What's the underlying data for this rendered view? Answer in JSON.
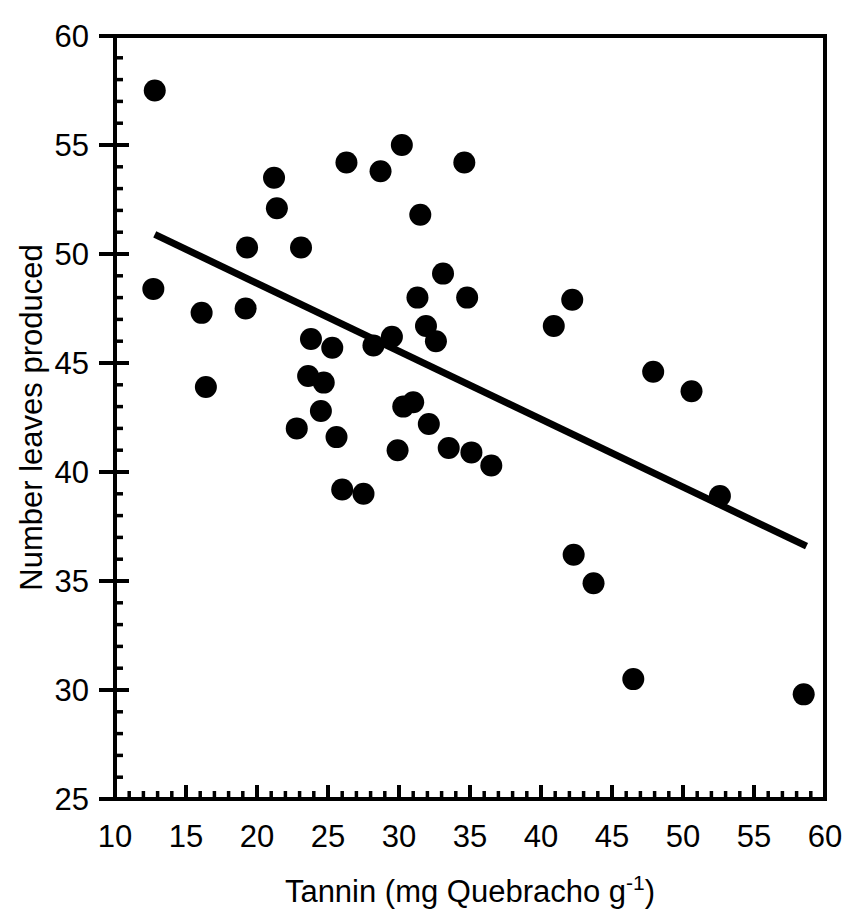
{
  "chart_data": {
    "type": "scatter",
    "title": "",
    "xlabel": "Tannin (mg Quebracho g-1)",
    "xlabel_base": "Tannin (mg Quebracho g",
    "xlabel_sup": "-1",
    "xlabel_tail": ")",
    "ylabel": "Number leaves produced",
    "xlim": [
      10,
      60
    ],
    "ylim": [
      25,
      60
    ],
    "xticks": [
      10,
      15,
      20,
      25,
      30,
      35,
      40,
      45,
      50,
      55,
      60
    ],
    "yticks": [
      25,
      30,
      35,
      40,
      45,
      50,
      55,
      60
    ],
    "xtick_labels": [
      "10",
      "15",
      "20",
      "25",
      "30",
      "35",
      "40",
      "45",
      "50",
      "55",
      "60"
    ],
    "ytick_labels": [
      "25",
      "30",
      "35",
      "40",
      "45",
      "50",
      "55",
      "60"
    ],
    "minor_tick_step": 1,
    "grid": false,
    "legend": null,
    "marker": "filled-circle",
    "marker_color": "#000000",
    "marker_size_px": 22,
    "points": [
      {
        "x": 12.8,
        "y": 57.5
      },
      {
        "x": 12.7,
        "y": 48.4
      },
      {
        "x": 16.1,
        "y": 47.3
      },
      {
        "x": 16.4,
        "y": 43.9
      },
      {
        "x": 19.2,
        "y": 47.5
      },
      {
        "x": 19.3,
        "y": 50.3
      },
      {
        "x": 21.2,
        "y": 53.5
      },
      {
        "x": 21.4,
        "y": 52.1
      },
      {
        "x": 22.8,
        "y": 42.0
      },
      {
        "x": 23.1,
        "y": 50.3
      },
      {
        "x": 23.6,
        "y": 44.4
      },
      {
        "x": 23.8,
        "y": 46.1
      },
      {
        "x": 24.5,
        "y": 42.8
      },
      {
        "x": 24.7,
        "y": 44.1
      },
      {
        "x": 25.3,
        "y": 45.7
      },
      {
        "x": 25.6,
        "y": 41.6
      },
      {
        "x": 26.0,
        "y": 39.2
      },
      {
        "x": 26.3,
        "y": 54.2
      },
      {
        "x": 27.5,
        "y": 39.0
      },
      {
        "x": 28.2,
        "y": 45.8
      },
      {
        "x": 28.7,
        "y": 53.8
      },
      {
        "x": 29.5,
        "y": 46.2
      },
      {
        "x": 29.9,
        "y": 41.0
      },
      {
        "x": 30.2,
        "y": 55.0
      },
      {
        "x": 30.3,
        "y": 43.0
      },
      {
        "x": 31.0,
        "y": 43.2
      },
      {
        "x": 31.3,
        "y": 48.0
      },
      {
        "x": 31.5,
        "y": 51.8
      },
      {
        "x": 31.9,
        "y": 46.7
      },
      {
        "x": 32.1,
        "y": 42.2
      },
      {
        "x": 32.6,
        "y": 46.0
      },
      {
        "x": 33.1,
        "y": 49.1
      },
      {
        "x": 33.5,
        "y": 41.1
      },
      {
        "x": 34.6,
        "y": 54.2
      },
      {
        "x": 34.8,
        "y": 48.0
      },
      {
        "x": 35.1,
        "y": 40.9
      },
      {
        "x": 36.5,
        "y": 40.3
      },
      {
        "x": 40.9,
        "y": 46.7
      },
      {
        "x": 42.2,
        "y": 47.9
      },
      {
        "x": 42.3,
        "y": 36.2
      },
      {
        "x": 43.7,
        "y": 34.9
      },
      {
        "x": 46.5,
        "y": 30.5
      },
      {
        "x": 47.9,
        "y": 44.6
      },
      {
        "x": 50.6,
        "y": 43.7
      },
      {
        "x": 52.6,
        "y": 38.9
      },
      {
        "x": 58.5,
        "y": 29.8
      }
    ],
    "trendline": {
      "label": "regression line",
      "x1": 12.8,
      "y1": 50.9,
      "x2": 58.7,
      "y2": 36.6,
      "color": "#000000",
      "width_px": 7
    }
  }
}
